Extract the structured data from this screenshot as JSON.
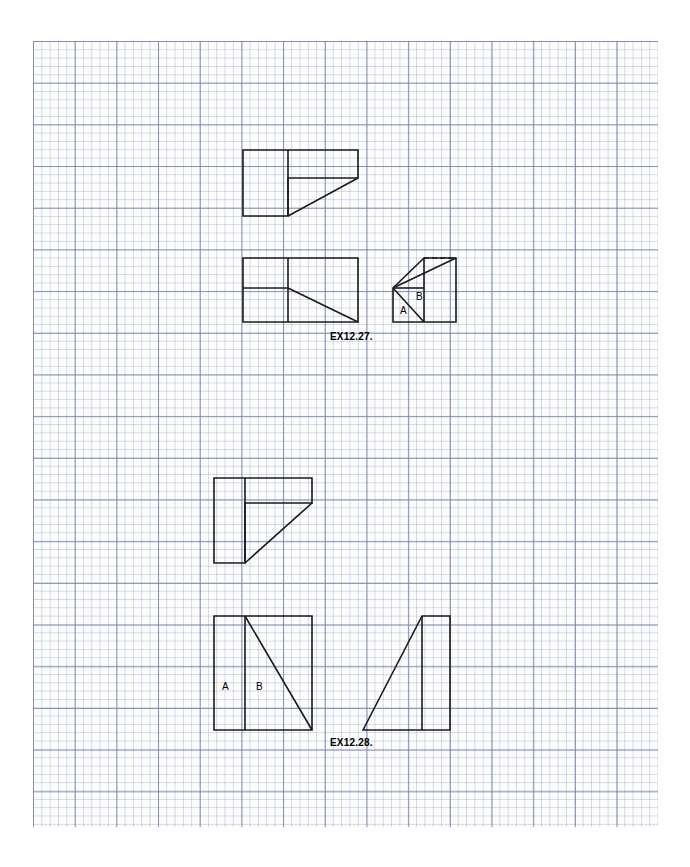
{
  "sheet": {
    "title": "Engineering Drawing Worksheet",
    "background_color": "#ffffff",
    "grid": {
      "name": "graph-paper",
      "major_color": "#7882aa",
      "minor_color": "#96a0c3",
      "minor_spacing_px": 8.34,
      "major_spacing_px": 41.7,
      "left": 33,
      "top": 41,
      "width": 625,
      "height": 786
    },
    "line_color": "#1a1a1a"
  },
  "exercises": [
    {
      "id": "ex-12-27",
      "label": "EX12.27.",
      "label_x": 330,
      "label_y": 331,
      "views": [
        {
          "name": "top-view",
          "outline_points": "243,150 358,150 358,178 288,178 288,216 243,216",
          "internal_lines": [
            {
              "name": "vertical-divider",
              "x1": 288,
              "y1": 150,
              "x2": 288,
              "y2": 216
            },
            {
              "name": "inclined-edge",
              "x1": 288,
              "y1": 216,
              "x2": 358,
              "y2": 178
            }
          ]
        },
        {
          "name": "front-view",
          "outline_points": "243,258 358,258 358,322 243,322",
          "internal_lines": [
            {
              "name": "vertical-divider",
              "x1": 288,
              "y1": 258,
              "x2": 288,
              "y2": 322
            },
            {
              "name": "horizontal-divider",
              "x1": 243,
              "y1": 288,
              "x2": 288,
              "y2": 288
            },
            {
              "name": "inclined-edge",
              "x1": 288,
              "y1": 288,
              "x2": 358,
              "y2": 322
            }
          ]
        },
        {
          "name": "side-view",
          "outline_points": "393,288 424,258 456,258 456,322 393,322",
          "internal_lines": [
            {
              "name": "horizontal-divider",
              "x1": 393,
              "y1": 288,
              "x2": 424,
              "y2": 288
            },
            {
              "name": "inclined-edge",
              "x1": 393,
              "y1": 288,
              "x2": 424,
              "y2": 322
            },
            {
              "name": "vertical-divider",
              "x1": 424,
              "y1": 258,
              "x2": 424,
              "y2": 322
            }
          ],
          "hidden_lines": [
            {
              "name": "hidden-inclined-edge",
              "x1": 424,
              "y1": 258,
              "x2": 456,
              "y2": 258
            }
          ],
          "face_labels": [
            {
              "text": "A",
              "x": 403,
              "y": 311
            },
            {
              "text": "B",
              "x": 419,
              "y": 298
            }
          ]
        }
      ]
    },
    {
      "id": "ex-12-28",
      "label": "EX12.28.",
      "label_x": 330,
      "label_y": 737,
      "views": [
        {
          "name": "top-view",
          "outline_points": "214,478 312,478 312,503 245,503 245,563 214,563",
          "internal_lines": [
            {
              "name": "vertical-divider",
              "x1": 245,
              "y1": 478,
              "x2": 245,
              "y2": 563
            },
            {
              "name": "inclined-edge",
              "x1": 245,
              "y1": 563,
              "x2": 312,
              "y2": 503
            }
          ]
        },
        {
          "name": "front-view",
          "outline_points": "214,616 312,616 312,730 214,730",
          "internal_lines": [
            {
              "name": "vertical-divider",
              "x1": 245,
              "y1": 616,
              "x2": 245,
              "y2": 730
            },
            {
              "name": "inclined-edge",
              "x1": 245,
              "y1": 616,
              "x2": 312,
              "y2": 730
            }
          ],
          "face_labels": [
            {
              "text": "A",
              "x": 225,
              "y": 687
            },
            {
              "text": "B",
              "x": 259,
              "y": 687
            }
          ]
        },
        {
          "name": "side-view",
          "outline_points": "363,730 422,616 450,616 450,730",
          "internal_lines": [
            {
              "name": "vertical-divider",
              "x1": 422,
              "y1": 616,
              "x2": 422,
              "y2": 730
            }
          ]
        }
      ]
    }
  ]
}
